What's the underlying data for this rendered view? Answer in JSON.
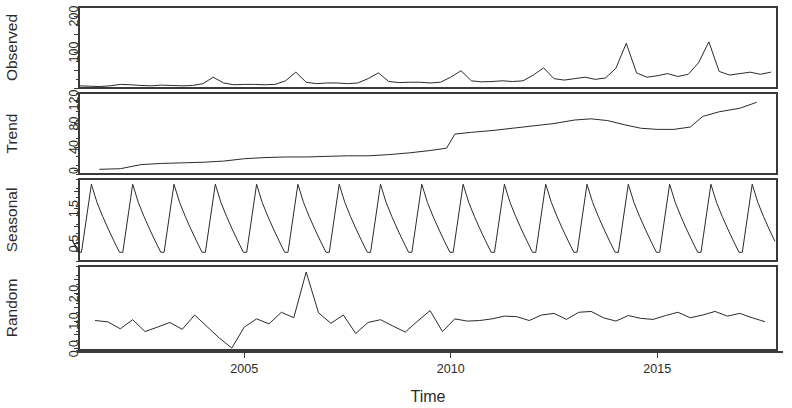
{
  "figure": {
    "xlabel": "Time",
    "panels": [
      "Observed",
      "Trend",
      "Seasonal",
      "Random"
    ]
  },
  "axes": {
    "x_ticks": [
      2005,
      2010,
      2015
    ],
    "x_tick_labels": [
      "2005",
      "2010",
      "2015"
    ],
    "x_range": [
      2001.0,
      2017.9
    ]
  },
  "chart_data": {
    "type": "line",
    "title": "",
    "subtitle": "",
    "xlabel": "Time",
    "ylabel": "",
    "grid": false,
    "legend": "none",
    "decomposition": "multiplicative time series decomposition",
    "x_range": [
      2001.0,
      2017.9
    ],
    "x_ticks": [
      2005,
      2010,
      2015
    ],
    "x_tick_labels": [
      "2005",
      "2010",
      "2015"
    ],
    "panels": [
      {
        "name": "Observed",
        "ylabel": "Observed",
        "ylim": [
          0,
          225
        ],
        "yticks": [
          0,
          50,
          100,
          150,
          200
        ],
        "ytick_labels": [
          "",
          "",
          "100",
          "",
          "200"
        ],
        "labeled_yticks": [
          100,
          200
        ],
        "x": [
          2001.0,
          2001.25,
          2001.5,
          2001.75,
          2002.0,
          2002.25,
          2002.5,
          2002.75,
          2003.0,
          2003.25,
          2003.5,
          2003.75,
          2004.0,
          2004.25,
          2004.5,
          2004.75,
          2005.0,
          2005.25,
          2005.5,
          2005.75,
          2006.0,
          2006.25,
          2006.5,
          2006.75,
          2007.0,
          2007.25,
          2007.5,
          2007.75,
          2008.0,
          2008.25,
          2008.5,
          2008.75,
          2009.0,
          2009.25,
          2009.5,
          2009.75,
          2010.0,
          2010.25,
          2010.5,
          2010.75,
          2011.0,
          2011.25,
          2011.5,
          2011.75,
          2012.0,
          2012.25,
          2012.5,
          2012.75,
          2013.0,
          2013.25,
          2013.5,
          2013.75,
          2014.0,
          2014.25,
          2014.5,
          2014.75,
          2015.0,
          2015.25,
          2015.5,
          2015.75,
          2016.0,
          2016.25,
          2016.5,
          2016.75,
          2017.0,
          2017.25,
          2017.5,
          2017.75
        ],
        "y": [
          6,
          5,
          4,
          6,
          10,
          9,
          7,
          6,
          8,
          7,
          6,
          7,
          12,
          30,
          14,
          9,
          10,
          10,
          9,
          10,
          20,
          44,
          16,
          12,
          14,
          14,
          12,
          14,
          26,
          42,
          18,
          15,
          16,
          16,
          14,
          16,
          30,
          48,
          20,
          17,
          18,
          20,
          18,
          20,
          36,
          56,
          26,
          22,
          26,
          30,
          24,
          28,
          55,
          124,
          42,
          30,
          34,
          40,
          32,
          38,
          70,
          128,
          46,
          36,
          40,
          44,
          38,
          44
        ]
      },
      {
        "name": "Trend",
        "ylabel": "Trend",
        "ylim": [
          -6,
          132
        ],
        "yticks": [
          0,
          40,
          80,
          120
        ],
        "ytick_labels": [
          "0",
          "40",
          "80",
          "120"
        ],
        "labeled_yticks": [
          0,
          40,
          80,
          120
        ],
        "x": [
          2001.5,
          2002.0,
          2002.5,
          2003.0,
          2003.5,
          2004.0,
          2004.5,
          2005.0,
          2005.5,
          2006.0,
          2006.5,
          2007.0,
          2007.5,
          2008.0,
          2008.5,
          2009.0,
          2009.5,
          2009.9,
          2010.1,
          2010.5,
          2011.0,
          2011.5,
          2012.0,
          2012.5,
          2013.0,
          2013.4,
          2013.8,
          2014.2,
          2014.6,
          2015.0,
          2015.4,
          2015.8,
          2016.1,
          2016.5,
          2017.0,
          2017.4
        ],
        "y": [
          2,
          3,
          10,
          12,
          13,
          14,
          16,
          20,
          22,
          23,
          23,
          24,
          25,
          25,
          27,
          30,
          34,
          38,
          62,
          65,
          68,
          72,
          76,
          80,
          86,
          88,
          85,
          78,
          72,
          70,
          70,
          74,
          92,
          100,
          106,
          116
        ]
      },
      {
        "name": "Seasonal",
        "ylabel": "Seasonal",
        "ylim": [
          0.0,
          2.35
        ],
        "yticks": [
          0.5,
          1.0,
          1.5,
          2.0
        ],
        "ytick_labels": [
          "0.5",
          "",
          "1.5",
          ""
        ],
        "labeled_yticks": [
          0.5,
          1.5
        ],
        "period": 1.0,
        "peak_value": 2.2,
        "trough_value": 0.25,
        "n_cycles": 17,
        "shape": "sawtooth: sharp rise to annual peak then gradual decay"
      },
      {
        "name": "Random",
        "ylabel": "Random",
        "ylim": [
          -0.05,
          3.0
        ],
        "yticks": [
          0.0,
          0.5,
          1.0,
          1.5,
          2.0,
          2.5
        ],
        "ytick_labels": [
          "0.0",
          "",
          "1.0",
          "",
          "2.0",
          ""
        ],
        "labeled_yticks": [
          0.0,
          1.0,
          2.0
        ],
        "x": [
          2001.4,
          2001.7,
          2002.0,
          2002.3,
          2002.6,
          2002.9,
          2003.2,
          2003.5,
          2003.8,
          2004.1,
          2004.4,
          2004.7,
          2005.0,
          2005.3,
          2005.6,
          2005.9,
          2006.2,
          2006.5,
          2006.8,
          2007.1,
          2007.4,
          2007.7,
          2008.0,
          2008.3,
          2008.6,
          2008.9,
          2009.2,
          2009.5,
          2009.8,
          2010.1,
          2010.4,
          2010.7,
          2011.0,
          2011.3,
          2011.6,
          2011.9,
          2012.2,
          2012.5,
          2012.8,
          2013.1,
          2013.4,
          2013.7,
          2014.0,
          2014.3,
          2014.6,
          2014.9,
          2015.2,
          2015.5,
          2015.8,
          2016.1,
          2016.4,
          2016.7,
          2017.0,
          2017.3,
          2017.6
        ],
        "y": [
          1.02,
          0.97,
          0.72,
          1.05,
          0.62,
          0.78,
          0.95,
          0.7,
          1.22,
          0.8,
          0.38,
          0.02,
          0.78,
          1.08,
          0.9,
          1.32,
          1.12,
          2.78,
          1.3,
          0.92,
          1.22,
          0.55,
          0.95,
          1.05,
          0.82,
          0.6,
          1.0,
          1.38,
          0.62,
          1.08,
          1.0,
          1.02,
          1.08,
          1.18,
          1.16,
          1.02,
          1.22,
          1.28,
          1.06,
          1.32,
          1.35,
          1.12,
          1.0,
          1.2,
          1.1,
          1.06,
          1.2,
          1.32,
          1.12,
          1.22,
          1.35,
          1.18,
          1.28,
          1.12,
          0.98
        ]
      }
    ]
  }
}
